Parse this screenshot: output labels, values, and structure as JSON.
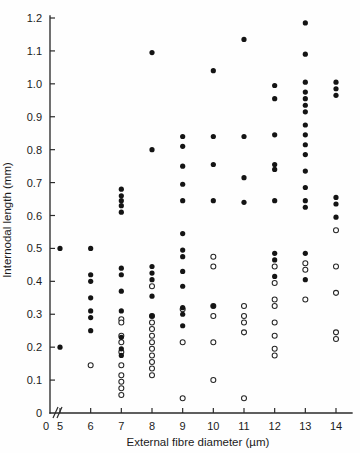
{
  "chart_data": {
    "type": "scatter",
    "title": "",
    "xlabel": "External fibre diameter (µm)",
    "ylabel": "Internodal length (mm)",
    "xlim": [
      4.55,
      14.45
    ],
    "ylim": [
      0,
      1.2
    ],
    "grid": false,
    "legend_position": "none",
    "x_axis_break": true,
    "x_axis_break_label": "0",
    "xticks": [
      5,
      6,
      7,
      8,
      9,
      10,
      11,
      12,
      13,
      14
    ],
    "xtick_labels": [
      "5",
      "6",
      "7",
      "8",
      "9",
      "10",
      "11",
      "12",
      "13",
      "14"
    ],
    "yticks": [
      0,
      0.1,
      0.2,
      0.3,
      0.4,
      0.5,
      0.6,
      0.7,
      0.8,
      0.9,
      1.0,
      1.1,
      1.2
    ],
    "ytick_labels": [
      "0",
      "0.1",
      "0.2",
      "0.3",
      "0.4",
      "0.5",
      "0.6",
      "0.7",
      "0.8",
      "0.9",
      "1.0",
      "1.1",
      "1.2"
    ],
    "series": [
      {
        "name": "filled-marker-series",
        "marker": "filled-circle",
        "color": "#141414",
        "points": [
          [
            5,
            0.5
          ],
          [
            5,
            0.2
          ],
          [
            6,
            0.5
          ],
          [
            6,
            0.42
          ],
          [
            6,
            0.4
          ],
          [
            6,
            0.35
          ],
          [
            6,
            0.31
          ],
          [
            6,
            0.29
          ],
          [
            6,
            0.25
          ],
          [
            7,
            0.68
          ],
          [
            7,
            0.66
          ],
          [
            7,
            0.645
          ],
          [
            7,
            0.63
          ],
          [
            7,
            0.61
          ],
          [
            7,
            0.44
          ],
          [
            7,
            0.42
          ],
          [
            7,
            0.37
          ],
          [
            7,
            0.31
          ],
          [
            7,
            0.23
          ],
          [
            7,
            0.195
          ],
          [
            7,
            0.175
          ],
          [
            8,
            1.095
          ],
          [
            8,
            0.8
          ],
          [
            8,
            0.445
          ],
          [
            8,
            0.425
          ],
          [
            8,
            0.405
          ],
          [
            8,
            0.355
          ],
          [
            8,
            0.295
          ],
          [
            9,
            0.84
          ],
          [
            9,
            0.81
          ],
          [
            9,
            0.75
          ],
          [
            9,
            0.695
          ],
          [
            9,
            0.645
          ],
          [
            9,
            0.545
          ],
          [
            9,
            0.495
          ],
          [
            9,
            0.475
          ],
          [
            9,
            0.43
          ],
          [
            9,
            0.385
          ],
          [
            9,
            0.32
          ],
          [
            9,
            0.3
          ],
          [
            9,
            0.265
          ],
          [
            10,
            1.04
          ],
          [
            10,
            0.84
          ],
          [
            10,
            0.755
          ],
          [
            10,
            0.645
          ],
          [
            10,
            0.325
          ],
          [
            11,
            1.135
          ],
          [
            11,
            0.84
          ],
          [
            11,
            0.715
          ],
          [
            11,
            0.64
          ],
          [
            12,
            0.995
          ],
          [
            12,
            0.955
          ],
          [
            12,
            0.845
          ],
          [
            12,
            0.755
          ],
          [
            12,
            0.74
          ],
          [
            12,
            0.645
          ],
          [
            12,
            0.485
          ],
          [
            12,
            0.465
          ],
          [
            12,
            0.415
          ],
          [
            13,
            1.185
          ],
          [
            13,
            1.09
          ],
          [
            13,
            1.005
          ],
          [
            13,
            0.975
          ],
          [
            13,
            0.955
          ],
          [
            13,
            0.935
          ],
          [
            13,
            0.915
          ],
          [
            13,
            0.875
          ],
          [
            13,
            0.845
          ],
          [
            13,
            0.815
          ],
          [
            13,
            0.785
          ],
          [
            13,
            0.735
          ],
          [
            13,
            0.685
          ],
          [
            13,
            0.645
          ],
          [
            13,
            0.625
          ],
          [
            13,
            0.485
          ],
          [
            13,
            0.405
          ],
          [
            14,
            1.005
          ],
          [
            14,
            0.985
          ],
          [
            14,
            0.965
          ],
          [
            14,
            0.655
          ],
          [
            14,
            0.635
          ],
          [
            14,
            0.595
          ]
        ]
      },
      {
        "name": "open-marker-series",
        "marker": "open-circle",
        "color": "#ffffff",
        "points": [
          [
            6,
            0.145
          ],
          [
            7,
            0.285
          ],
          [
            7,
            0.275
          ],
          [
            7,
            0.235
          ],
          [
            7,
            0.215
          ],
          [
            7,
            0.185
          ],
          [
            7,
            0.145
          ],
          [
            7,
            0.115
          ],
          [
            7,
            0.095
          ],
          [
            7,
            0.075
          ],
          [
            7,
            0.055
          ],
          [
            8,
            0.385
          ],
          [
            8,
            0.295
          ],
          [
            8,
            0.275
          ],
          [
            8,
            0.255
          ],
          [
            8,
            0.235
          ],
          [
            8,
            0.215
          ],
          [
            8,
            0.195
          ],
          [
            8,
            0.175
          ],
          [
            8,
            0.155
          ],
          [
            8,
            0.135
          ],
          [
            8,
            0.115
          ],
          [
            9,
            0.315
          ],
          [
            9,
            0.215
          ],
          [
            9,
            0.045
          ],
          [
            10,
            0.475
          ],
          [
            10,
            0.445
          ],
          [
            10,
            0.325
          ],
          [
            10,
            0.295
          ],
          [
            10,
            0.215
          ],
          [
            10,
            0.1
          ],
          [
            11,
            0.325
          ],
          [
            11,
            0.295
          ],
          [
            11,
            0.275
          ],
          [
            11,
            0.245
          ],
          [
            11,
            0.045
          ],
          [
            12,
            0.445
          ],
          [
            12,
            0.395
          ],
          [
            12,
            0.345
          ],
          [
            12,
            0.325
          ],
          [
            12,
            0.275
          ],
          [
            12,
            0.235
          ],
          [
            12,
            0.195
          ],
          [
            12,
            0.175
          ],
          [
            13,
            0.455
          ],
          [
            13,
            0.435
          ],
          [
            13,
            0.345
          ],
          [
            14,
            0.555
          ],
          [
            14,
            0.445
          ],
          [
            14,
            0.365
          ],
          [
            14,
            0.245
          ],
          [
            14,
            0.225
          ]
        ]
      }
    ]
  }
}
